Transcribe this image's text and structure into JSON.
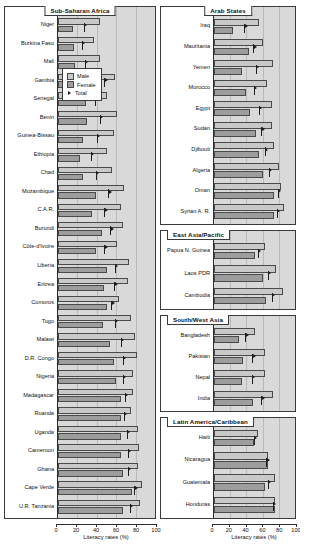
{
  "legend": {
    "male_label": "Male",
    "female_label": "Female",
    "total_label": "Total"
  },
  "axis": {
    "title": "Literacy rates (%)",
    "ticks": [
      0,
      20,
      40,
      60,
      80,
      100
    ]
  },
  "chart_data": {
    "type": "bar",
    "title": "Literacy rates (%)",
    "xlabel": "Literacy rates (%)",
    "ylabel": "",
    "xlim": [
      0,
      100
    ],
    "grid": true,
    "legend_position": "top-right of first panel",
    "orientation": "horizontal",
    "series_names": [
      "Male",
      "Female",
      "Total"
    ],
    "panels": [
      {
        "title": "Sub-Saharan Africa",
        "categories": [
          "Niger",
          "Burkina Faso",
          "Mali",
          "Gambia",
          "Senegal",
          "Benin",
          "Guinea-Bissau",
          "Ethiopia",
          "Chad",
          "Mozambique",
          "C.A.R.",
          "Burundi",
          "Côte-d'Ivoire",
          "Liberia",
          "Eritrea",
          "Comoros",
          "Togo",
          "Malawi",
          "D.R. Congo",
          "Nigeria",
          "Madagascar",
          "Ruanda",
          "Uganda",
          "Cameroon",
          "Ghana",
          "Cape Verde",
          "U.R. Tanzania"
        ],
        "series": [
          {
            "name": "Male",
            "values": [
              43,
              37,
              43,
              59,
              51,
              61,
              58,
              50,
              56,
              68,
              65,
              67,
              61,
              73,
              72,
              63,
              75,
              79,
              81,
              77,
              77,
              75,
              82,
              84,
              82,
              87,
              85
            ]
          },
          {
            "name": "Female",
            "values": [
              15,
              16,
              18,
              41,
              29,
              30,
              26,
              23,
              26,
              39,
              35,
              45,
              39,
              50,
              47,
              50,
              46,
              54,
              58,
              60,
              65,
              65,
              65,
              65,
              67,
              76,
              67
            ]
          },
          {
            "name": "Total",
            "values": [
              29,
              27,
              30,
              50,
              40,
              45,
              42,
              36,
              41,
              54,
              50,
              56,
              50,
              61,
              60,
              57,
              61,
              67,
              69,
              69,
              71,
              70,
              73,
              74,
              74,
              81,
              76
            ]
          }
        ]
      },
      {
        "title": "Arab States",
        "categories": [
          "Iraq",
          "Mauritania",
          "Yemen",
          "Morocco",
          "Egypt",
          "Sudan",
          "Djibouti",
          "Algeria",
          "Oman",
          "Syrian A. R."
        ],
        "series": [
          {
            "name": "Male",
            "values": [
              56,
              60,
              73,
              66,
              72,
              71,
              74,
              80,
              83,
              86
            ]
          },
          {
            "name": "Female",
            "values": [
              24,
              43,
              35,
              40,
              44,
              52,
              55,
              60,
              74,
              74
            ]
          },
          {
            "name": "Total",
            "values": [
              40,
              51,
              54,
              52,
              58,
              61,
              65,
              70,
              81,
              80
            ]
          }
        ]
      },
      {
        "title": "East Asia/Pacific",
        "categories": [
          "Papua N. Guinea",
          "Laos PDR",
          "Cambodia"
        ],
        "series": [
          {
            "name": "Male",
            "values": [
              63,
              77,
              85
            ]
          },
          {
            "name": "Female",
            "values": [
              51,
              61,
              64
            ]
          },
          {
            "name": "Total",
            "values": [
              57,
              69,
              74
            ]
          }
        ]
      },
      {
        "title": "South/West Asia",
        "categories": [
          "Bangladesh",
          "Pakistan",
          "Nepal",
          "India"
        ],
        "series": [
          {
            "name": "Male",
            "values": [
              50,
              63,
              63,
              73
            ]
          },
          {
            "name": "Female",
            "values": [
              31,
              36,
              35,
              48
            ]
          },
          {
            "name": "Total",
            "values": [
              41,
              50,
              49,
              61
            ]
          }
        ]
      },
      {
        "title": "Latin America/Caribbean",
        "categories": [
          "Haiti",
          "Nicaragua",
          "Guatemala",
          "Honduras"
        ],
        "series": [
          {
            "name": "Male",
            "values": [
              54,
              67,
              75,
              75
            ]
          },
          {
            "name": "Female",
            "values": [
              49,
              67,
              63,
              75
            ]
          },
          {
            "name": "Total",
            "values": [
              52,
              67,
              69,
              75
            ]
          }
        ]
      }
    ]
  }
}
